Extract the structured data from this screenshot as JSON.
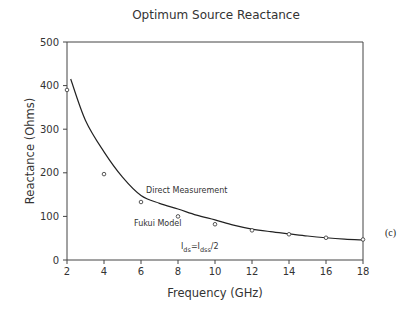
{
  "chart_data": {
    "type": "line",
    "title": "Optimum Source Reactance",
    "xlabel": "Frequency (GHz)",
    "ylabel": "Reactance (Ohms)",
    "xlim": [
      2,
      18
    ],
    "ylim": [
      0,
      500
    ],
    "xticks": [
      2,
      4,
      6,
      8,
      10,
      12,
      14,
      16,
      18
    ],
    "yticks": [
      0,
      100,
      200,
      300,
      400,
      500
    ],
    "grid": false,
    "series": [
      {
        "name": "Fukui Model",
        "kind": "line",
        "x": [
          2.2,
          3,
          4,
          5,
          6,
          7,
          8,
          9,
          10,
          11,
          12,
          13,
          14,
          15,
          16,
          17,
          18
        ],
        "values": [
          415,
          320,
          248,
          190,
          148,
          130,
          117,
          103,
          92,
          80,
          71,
          65,
          60,
          55,
          51,
          48,
          46
        ]
      },
      {
        "name": "Direct Measurement",
        "kind": "scatter",
        "x": [
          2,
          4,
          6,
          8,
          10,
          12,
          14,
          16,
          18
        ],
        "values": [
          390,
          197,
          133,
          100,
          82,
          68,
          59,
          51,
          47
        ]
      }
    ],
    "annotations": [
      {
        "text": "Direct Measurement",
        "x": 7.6,
        "y": 160
      },
      {
        "text": "Fukui Model",
        "x": 5.8,
        "y": 85
      },
      {
        "text_main": "I",
        "sub1": "ds",
        "eq": "=I",
        "sub2": "dss",
        "tail": "/2",
        "x": 8.2,
        "y": 27
      }
    ],
    "panel_label": "(c)"
  }
}
